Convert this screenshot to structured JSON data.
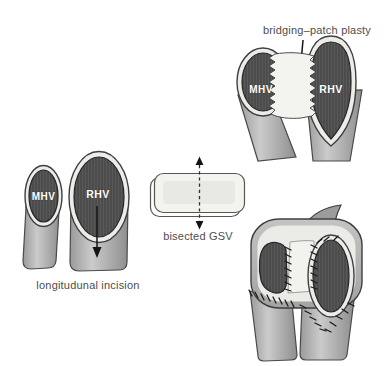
{
  "canvas": {
    "width": 384,
    "height": 366,
    "background": "#ffffff"
  },
  "palette": {
    "vessel_wall": "#b2b2b2",
    "vessel_lumen": "#4d4d4d",
    "cuff_ring": "#ecece9",
    "graft_patch": "#f3f3f0",
    "outline": "#3f3f3f",
    "caption_text": "#4d4d4d",
    "vessel_label_text": "#ffffff"
  },
  "figures": {
    "incision": {
      "caption": "longitudunal incision",
      "left_vessel_label": "MHV",
      "right_vessel_label": "RHV"
    },
    "graft": {
      "caption": "bisected GSV"
    },
    "patch_plasty": {
      "title": "bridging–patch plasty",
      "left_vessel_label": "MHV",
      "right_vessel_label": "RHV"
    }
  }
}
